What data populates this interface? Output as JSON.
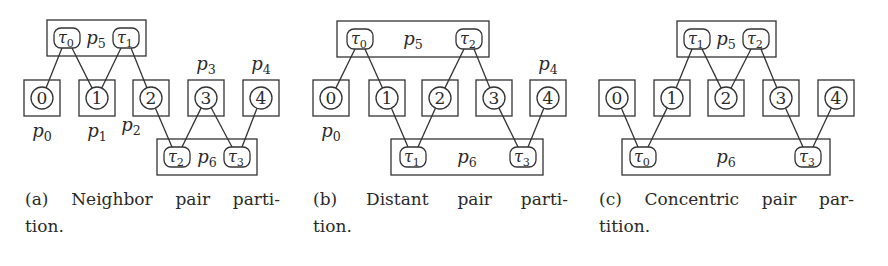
{
  "figure": {
    "panels": [
      {
        "id": "a",
        "caption_line1": "(a) Neighbor pair parti-",
        "caption_line2": "tion.",
        "caption_x": 25,
        "procs": [
          {
            "num": "0",
            "x": 24,
            "label": "p",
            "sub": "0",
            "label_pos": "below"
          },
          {
            "num": "1",
            "x": 79,
            "label": "p",
            "sub": "1",
            "label_pos": "below"
          },
          {
            "num": "2",
            "x": 133,
            "label": "p",
            "sub": "2",
            "label_pos": "below-left"
          },
          {
            "num": "3",
            "x": 188,
            "label": "p",
            "sub": "3",
            "label_pos": "above"
          },
          {
            "num": "4",
            "x": 243,
            "label": "p",
            "sub": "4",
            "label_pos": "above"
          }
        ],
        "groups": [
          {
            "name": "p",
            "sub": "5",
            "x": 47,
            "y": 20,
            "w": 99,
            "label_x": 96,
            "tasks": [
              {
                "sym": "τ",
                "sub": "0",
                "cx": 67,
                "links": [
                  0,
                  1
                ]
              },
              {
                "sym": "τ",
                "sub": "1",
                "cx": 126,
                "links": [
                  1,
                  2
                ]
              }
            ]
          },
          {
            "name": "p",
            "sub": "6",
            "x": 157,
            "y": 139,
            "w": 100,
            "label_x": 207,
            "tasks": [
              {
                "sym": "τ",
                "sub": "2",
                "cx": 177,
                "links": [
                  2,
                  3
                ]
              },
              {
                "sym": "τ",
                "sub": "3",
                "cx": 237,
                "links": [
                  3,
                  4
                ]
              }
            ]
          }
        ]
      },
      {
        "id": "b",
        "caption_line1": "(b) Distant pair parti-",
        "caption_line2": "tion.",
        "caption_x": 313,
        "procs": [
          {
            "num": "0",
            "x": 313,
            "label": "p",
            "sub": "0",
            "label_pos": "below"
          },
          {
            "num": "1",
            "x": 369,
            "label": "",
            "sub": "",
            "label_pos": "none"
          },
          {
            "num": "2",
            "x": 422,
            "label": "",
            "sub": "",
            "label_pos": "none"
          },
          {
            "num": "3",
            "x": 476,
            "label": "",
            "sub": "",
            "label_pos": "none"
          },
          {
            "num": "4",
            "x": 530,
            "label": "p",
            "sub": "4",
            "label_pos": "above"
          }
        ],
        "groups": [
          {
            "name": "p",
            "sub": "5",
            "x": 337,
            "y": 21,
            "w": 152,
            "label_x": 413,
            "tasks": [
              {
                "sym": "τ",
                "sub": "0",
                "cx": 360,
                "links": [
                  0,
                  1
                ]
              },
              {
                "sym": "τ",
                "sub": "2",
                "cx": 469,
                "links": [
                  2,
                  3
                ]
              }
            ]
          },
          {
            "name": "p",
            "sub": "6",
            "x": 391,
            "y": 139,
            "w": 152,
            "label_x": 467,
            "tasks": [
              {
                "sym": "τ",
                "sub": "1",
                "cx": 413,
                "links": [
                  1,
                  2
                ]
              },
              {
                "sym": "τ",
                "sub": "3",
                "cx": 523,
                "links": [
                  3,
                  4
                ]
              }
            ]
          }
        ]
      },
      {
        "id": "c",
        "caption_line1": "(c) Concentric pair par-",
        "caption_line2": "tition.",
        "caption_x": 599,
        "procs": [
          {
            "num": "0",
            "x": 599,
            "label": "",
            "sub": "",
            "label_pos": "none"
          },
          {
            "num": "1",
            "x": 654,
            "label": "",
            "sub": "",
            "label_pos": "none"
          },
          {
            "num": "2",
            "x": 708,
            "label": "",
            "sub": "",
            "label_pos": "none"
          },
          {
            "num": "3",
            "x": 763,
            "label": "",
            "sub": "",
            "label_pos": "none"
          },
          {
            "num": "4",
            "x": 818,
            "label": "",
            "sub": "",
            "label_pos": "none"
          }
        ],
        "groups": [
          {
            "name": "p",
            "sub": "5",
            "x": 677,
            "y": 21,
            "w": 99,
            "label_x": 726,
            "tasks": [
              {
                "sym": "τ",
                "sub": "1",
                "cx": 697,
                "links": [
                  1,
                  2
                ]
              },
              {
                "sym": "τ",
                "sub": "2",
                "cx": 756,
                "links": [
                  2,
                  3
                ]
              }
            ]
          },
          {
            "name": "p",
            "sub": "6",
            "x": 622,
            "y": 139,
            "w": 208,
            "label_x": 726,
            "tasks": [
              {
                "sym": "τ",
                "sub": "0",
                "cx": 643,
                "links": [
                  0,
                  1
                ]
              },
              {
                "sym": "τ",
                "sub": "3",
                "cx": 808,
                "links": [
                  3,
                  4
                ]
              }
            ]
          }
        ]
      }
    ],
    "geometry": {
      "proc_box_y": 80,
      "proc_box_size": 36,
      "circle_r": 11,
      "group_h": 36,
      "pill_w": 26,
      "pill_h": 20
    },
    "colors": {
      "stroke": "#333333",
      "text": "#2a2a2a",
      "background": "#ffffff"
    }
  }
}
